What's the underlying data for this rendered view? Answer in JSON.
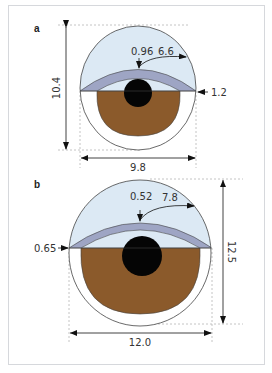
{
  "figure": {
    "panels": [
      {
        "id": "a",
        "label": "a",
        "height_label": "10.4",
        "width_label": "9.8",
        "lid_thickness_label": "0.96",
        "lid_radius_label": "6.6",
        "lid_edge_label": "1.2"
      },
      {
        "id": "b",
        "label": "b",
        "height_label": "12.5",
        "width_label": "12.0",
        "lid_thickness_label": "0.52",
        "lid_radius_label": "7.8",
        "lid_edge_label": "0.65"
      }
    ],
    "colors": {
      "cornea": "#dce9f4",
      "lid": "#9ea5c4",
      "iris": "#8b5a2b",
      "pupil": "#050505",
      "sclera": "#ffffff",
      "outline": "#444444",
      "dim_line": "#b5b5b5"
    }
  }
}
